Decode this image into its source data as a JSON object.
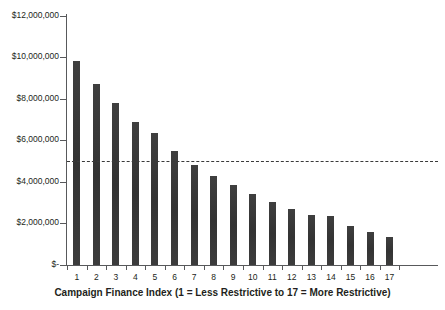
{
  "chart_data": {
    "type": "bar",
    "title": "",
    "subtitle": "",
    "xlabel": "Campaign Finance Index (1 = Less Restrictive to 17 = More Restrictive)",
    "ylabel": "",
    "categories": [
      "1",
      "2",
      "3",
      "4",
      "5",
      "6",
      "7",
      "8",
      "9",
      "10",
      "11",
      "12",
      "13",
      "14",
      "15",
      "16",
      "17"
    ],
    "values": [
      9850000,
      8700000,
      7800000,
      6900000,
      6350000,
      5500000,
      4800000,
      4300000,
      3850000,
      3400000,
      3050000,
      2700000,
      2400000,
      2350000,
      1900000,
      1600000,
      1350000
    ],
    "ylim": [
      0,
      12000000
    ],
    "ytick_values": [
      0,
      2000000,
      4000000,
      6000000,
      8000000,
      10000000,
      12000000
    ],
    "ytick_labels": [
      "$-",
      "$2,000,000",
      "$4,000,000",
      "$6,000,000",
      "$8,000,000",
      "$10,000,000",
      "$12,000,000"
    ],
    "grid": false,
    "legend": "none",
    "bar_color": "#3a3a3a",
    "axis_color": "#58595b",
    "annotations": [
      {
        "name": "reference-line",
        "type": "horizontal-dashed-line",
        "value": 5000000,
        "style": "dashed",
        "color": "#3a3a3a"
      }
    ]
  }
}
